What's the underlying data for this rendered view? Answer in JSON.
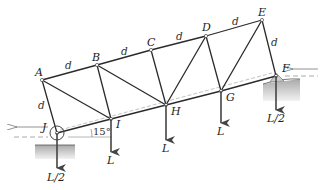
{
  "figure": {
    "type": "truss-diagram",
    "nodes": {
      "A": {
        "label": "A",
        "x": 42,
        "y": 80
      },
      "B": {
        "label": "B",
        "x": 97,
        "y": 65
      },
      "C": {
        "label": "C",
        "x": 151,
        "y": 50
      },
      "D": {
        "label": "D",
        "x": 206,
        "y": 36
      },
      "E": {
        "label": "E",
        "x": 262,
        "y": 20
      },
      "F": {
        "label": "F",
        "x": 276,
        "y": 76
      },
      "G": {
        "label": "G",
        "x": 221,
        "y": 91
      },
      "H": {
        "label": "H",
        "x": 166,
        "y": 105
      },
      "I": {
        "label": "I",
        "x": 111,
        "y": 119
      },
      "J": {
        "label": "J",
        "x": 57,
        "y": 133
      }
    },
    "dimension_label": "d",
    "angle_label": "15°",
    "loads": {
      "J": "L/2",
      "I": "L",
      "H": "L",
      "G": "L",
      "F": "L/2"
    },
    "colors": {
      "member": "#2b2b2b",
      "ground": "#c8c8c8",
      "arrow": "#444444",
      "dashed": "#888888"
    }
  }
}
